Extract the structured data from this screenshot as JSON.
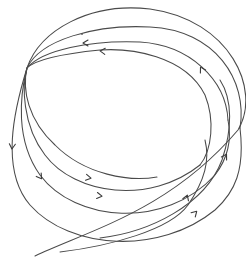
{
  "figure": {
    "type": "trajectory-diagram",
    "stroke_color": "#4a4a4a",
    "background": "#ffffff",
    "convergence_point": [
      27,
      68
    ]
  },
  "curves": [
    {
      "name": "loop-1-outer",
      "d": "M 35 256 C 90 230, 170 210, 238 130 C 262 90, 230 20, 150 9 C 90 2, 40 30, 27 68 C 14 110, 0 170, 30 205 C 70 250, 160 255, 215 210 C 235 192, 245 170, 240 128"
    },
    {
      "name": "loop-2",
      "d": "M 240 128 C 248 80, 215 30, 150 27 C 95 24, 40 40, 27 68 C 20 95, 15 140, 40 175 C 75 222, 165 230, 215 175 C 228 158, 232 140, 228 120"
    },
    {
      "name": "loop-3",
      "d": "M 228 120 C 226 80, 190 45, 140 42 C 90 40, 42 50, 27 68 C 22 85, 22 125, 45 155 C 75 195, 150 205, 200 165"
    },
    {
      "name": "loop-4-inner",
      "d": "M 200 165 C 212 150, 215 120, 205 95 C 185 55, 130 48, 100 50 C 60 54, 35 60, 27 68 C 22 90, 28 120, 55 145 C 85 175, 130 182, 157 177"
    },
    {
      "name": "cross-arc-a",
      "d": "M 60 252 C 110 246, 170 230, 188 205 C 205 180, 210 160, 205 140"
    },
    {
      "name": "cross-arc-b",
      "d": "M 100 238 C 150 232, 205 205, 222 160 C 232 130, 233 100, 220 80"
    }
  ],
  "arrows": [
    {
      "name": "arrow-top-right",
      "x": 201,
      "y": 68,
      "angle": -120
    },
    {
      "name": "arrow-top-inner-1",
      "x": 84,
      "y": 43,
      "angle": 180
    },
    {
      "name": "arrow-top-inner-2",
      "x": 101,
      "y": 51,
      "angle": 185
    },
    {
      "name": "arrow-left-down",
      "x": 12,
      "y": 148,
      "angle": 95
    },
    {
      "name": "arrow-left-mid",
      "x": 41,
      "y": 178,
      "angle": 55
    },
    {
      "name": "arrow-bottom-mid-1",
      "x": 90,
      "y": 178,
      "angle": 10
    },
    {
      "name": "arrow-bottom-mid-2",
      "x": 101,
      "y": 196,
      "angle": 8
    },
    {
      "name": "arrow-right-lower-1",
      "x": 187,
      "y": 196,
      "angle": -70
    },
    {
      "name": "arrow-right-lower-2",
      "x": 196,
      "y": 212,
      "angle": -45
    },
    {
      "name": "arrow-right-upper",
      "x": 226,
      "y": 155,
      "angle": -60
    }
  ],
  "marks": [
    {
      "name": "small-tick-mark",
      "x": 82,
      "y": 34
    }
  ]
}
